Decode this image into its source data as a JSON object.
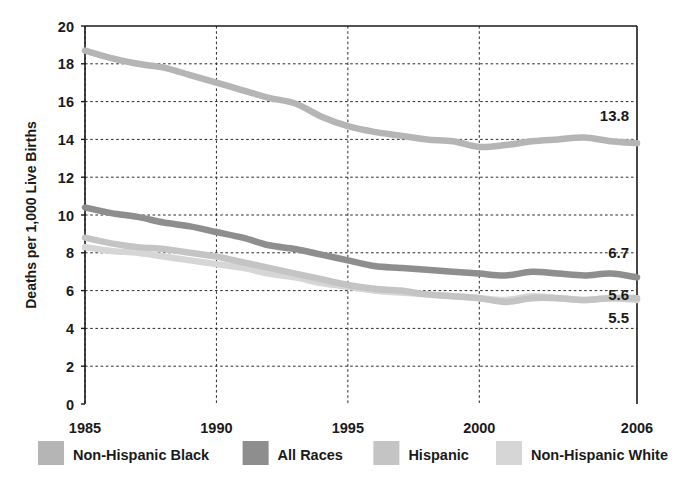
{
  "chart_data": {
    "type": "line",
    "title": "",
    "subtitle": "",
    "xlabel": "",
    "ylabel": "Deaths per 1,000 Live Births",
    "xlim": [
      1985,
      2006
    ],
    "ylim": [
      0,
      20
    ],
    "ytick_step": 2,
    "yticks": [
      "0",
      "2",
      "4",
      "6",
      "8",
      "10",
      "12",
      "14",
      "16",
      "18",
      "20"
    ],
    "ytick_values": [
      0,
      2,
      4,
      6,
      8,
      10,
      12,
      14,
      16,
      18,
      20
    ],
    "xticks": [
      "1985",
      "1990",
      "1995",
      "2000",
      "2006"
    ],
    "xtick_values": [
      1985,
      1990,
      1995,
      2000,
      2006
    ],
    "grid": "dotted horizontal and vertical gridlines",
    "legend_position": "bottom",
    "x": [
      1985,
      1986,
      1987,
      1988,
      1989,
      1990,
      1991,
      1992,
      1993,
      1994,
      1995,
      1996,
      1997,
      1998,
      1999,
      2000,
      2001,
      2002,
      2003,
      2004,
      2005,
      2006
    ],
    "series": [
      {
        "name": "Non-Hispanic Black",
        "color": "#b5b5b5",
        "end_label": "13.8",
        "end_value": 13.8,
        "values": [
          18.7,
          18.3,
          18.0,
          17.8,
          17.4,
          17.0,
          16.6,
          16.2,
          15.9,
          15.2,
          14.7,
          14.4,
          14.2,
          14.0,
          13.9,
          13.6,
          13.7,
          13.9,
          14.0,
          14.1,
          13.9,
          13.8
        ]
      },
      {
        "name": "All Races",
        "color": "#8e8e8e",
        "end_label": "6.7",
        "end_value": 6.7,
        "values": [
          10.4,
          10.1,
          9.9,
          9.6,
          9.4,
          9.1,
          8.8,
          8.4,
          8.2,
          7.9,
          7.6,
          7.3,
          7.2,
          7.1,
          7.0,
          6.9,
          6.8,
          7.0,
          6.9,
          6.8,
          6.9,
          6.7
        ]
      },
      {
        "name": "Hispanic",
        "color": "#c4c4c4",
        "end_label": "5.6",
        "end_value": 5.6,
        "values": [
          8.8,
          8.5,
          8.3,
          8.2,
          8.0,
          7.8,
          7.5,
          7.2,
          6.9,
          6.6,
          6.3,
          6.1,
          6.0,
          5.8,
          5.7,
          5.6,
          5.4,
          5.6,
          5.6,
          5.5,
          5.6,
          5.6
        ]
      },
      {
        "name": "Non-Hispanic White",
        "color": "#d6d6d6",
        "end_label": "5.5",
        "end_value": 5.5,
        "values": [
          8.3,
          8.1,
          8.0,
          7.8,
          7.6,
          7.4,
          7.2,
          6.9,
          6.7,
          6.4,
          6.2,
          6.0,
          5.9,
          5.8,
          5.7,
          5.6,
          5.5,
          5.7,
          5.6,
          5.5,
          5.6,
          5.5
        ]
      }
    ],
    "annotations": [
      {
        "text": "13.8",
        "series": "Non-Hispanic Black"
      },
      {
        "text": "6.7",
        "series": "All Races"
      },
      {
        "text": "5.6",
        "series": "Hispanic"
      },
      {
        "text": "5.5",
        "series": "Non-Hispanic White"
      }
    ]
  },
  "legend": {
    "items": [
      {
        "label": "Non-Hispanic Black",
        "color": "#b5b5b5"
      },
      {
        "label": "All Races",
        "color": "#8e8e8e"
      },
      {
        "label": "Hispanic",
        "color": "#c4c4c4"
      },
      {
        "label": "Non-Hispanic White",
        "color": "#d6d6d6"
      }
    ]
  },
  "axes": {
    "y_title": "Deaths per 1,000 Live Births"
  }
}
